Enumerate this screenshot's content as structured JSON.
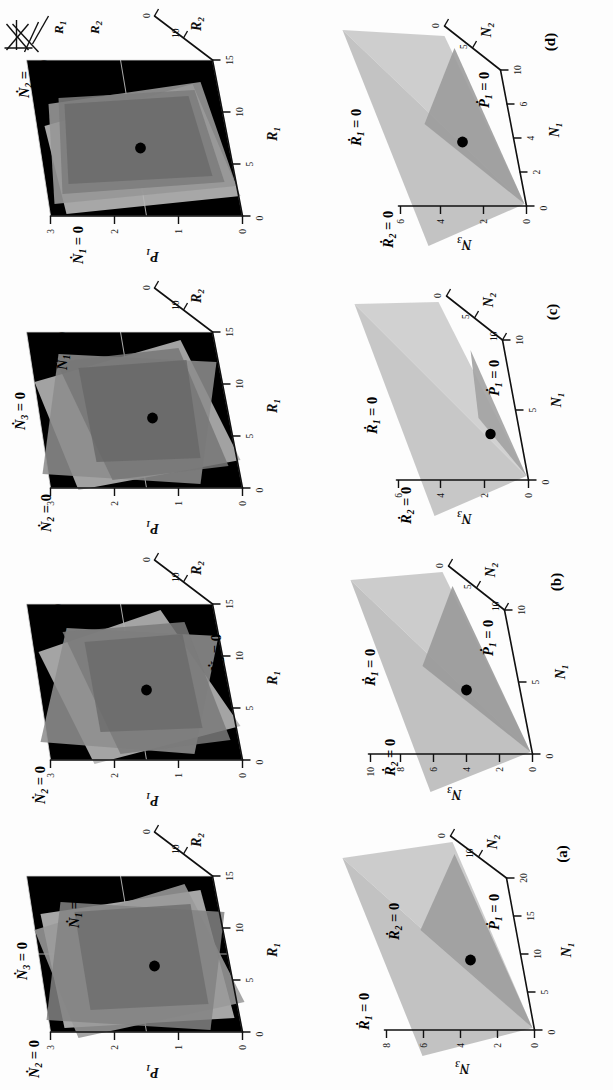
{
  "figure": {
    "orientation": "rotated-90-ccw",
    "panel_count": 4,
    "background": "#fdfdfd"
  },
  "inset": {
    "name": "food-web-diagram",
    "nodes": [
      "R1",
      "R2"
    ],
    "labels": {
      "r1": "R",
      "r1_sub": "1",
      "r2": "R",
      "r2_sub": "2"
    }
  },
  "palette": {
    "surface_light": "#c8c8c8",
    "surface_mid": "#a8a8a8",
    "surface_dark": "#8a8a8a",
    "surface_darker": "#6f6f6f",
    "axis": "#111111",
    "point": "#000000"
  },
  "panels": [
    {
      "id": "a",
      "label": "(a)",
      "top": {
        "name": "p1-r1-r2-nullclines",
        "axes": {
          "z": {
            "symbol": "P",
            "sub": "1",
            "ticks": [
              "0",
              "1",
              "2",
              "3"
            ]
          },
          "x": {
            "symbol": "R",
            "sub": "1",
            "ticks": [
              "0",
              "5",
              "10",
              "15"
            ]
          },
          "y": {
            "symbol": "R",
            "sub": "2",
            "ticks": [
              "10",
              "0"
            ]
          }
        },
        "surface_labels": [
          {
            "sym": "N",
            "sub": "2",
            "text": "= 0"
          },
          {
            "sym": "N",
            "sub": "3",
            "text": "= 0"
          },
          {
            "sym": "N",
            "sub": "1",
            "text": "= 0"
          }
        ],
        "equilibrium_point": true
      },
      "bottom": {
        "name": "n3-n1-n2-nullclines",
        "axes": {
          "z": {
            "symbol": "N",
            "sub": "3",
            "ticks": [
              "0",
              "2",
              "4",
              "6",
              "8"
            ]
          },
          "x": {
            "symbol": "N",
            "sub": "1",
            "ticks": [
              "0",
              "5",
              "10",
              "15",
              "20"
            ]
          },
          "y": {
            "symbol": "N",
            "sub": "2",
            "ticks": [
              "10",
              "0"
            ]
          }
        },
        "surface_labels": [
          {
            "sym": "R",
            "sub": "1",
            "text": "= 0"
          },
          {
            "sym": "R",
            "sub": "2",
            "text": "= 0"
          },
          {
            "sym": "P",
            "sub": "1",
            "text": "= 0"
          }
        ],
        "equilibrium_point": true
      }
    },
    {
      "id": "b",
      "label": "(b)",
      "top": {
        "name": "p1-r1-r2-nullclines",
        "axes": {
          "z": {
            "symbol": "P",
            "sub": "1",
            "ticks": [
              "0",
              "1",
              "2",
              "3"
            ]
          },
          "x": {
            "symbol": "R",
            "sub": "1",
            "ticks": [
              "0",
              "5",
              "10",
              "15"
            ]
          },
          "y": {
            "symbol": "R",
            "sub": "2",
            "ticks": [
              "10",
              "0"
            ]
          }
        },
        "surface_labels": [
          {
            "sym": "N",
            "sub": "2",
            "text": "= 0"
          },
          {
            "sym": "N",
            "sub": "1",
            "text": "= 0"
          },
          {
            "sym": "N",
            "sub": "3",
            "text": "= 0"
          }
        ],
        "equilibrium_point": true
      },
      "bottom": {
        "name": "n3-n1-n2-nullclines",
        "axes": {
          "z": {
            "symbol": "N",
            "sub": "3",
            "ticks": [
              "0",
              "2",
              "4",
              "6",
              "8",
              "10"
            ]
          },
          "x": {
            "symbol": "N",
            "sub": "1",
            "ticks": [
              "0",
              "5",
              "10"
            ]
          },
          "y": {
            "symbol": "N",
            "sub": "2",
            "ticks": [
              "10",
              "5",
              "0"
            ]
          }
        },
        "surface_labels": [
          {
            "sym": "R",
            "sub": "2",
            "text": "= 0"
          },
          {
            "sym": "R",
            "sub": "1",
            "text": "= 0"
          },
          {
            "sym": "P",
            "sub": "1",
            "text": "= 0"
          }
        ],
        "equilibrium_point": true
      }
    },
    {
      "id": "c",
      "label": "(c)",
      "top": {
        "name": "p1-r1-r2-nullclines",
        "axes": {
          "z": {
            "symbol": "P",
            "sub": "1",
            "ticks": [
              "0",
              "1",
              "2",
              "3"
            ]
          },
          "x": {
            "symbol": "R",
            "sub": "1",
            "ticks": [
              "0",
              "5",
              "10",
              "15"
            ]
          },
          "y": {
            "symbol": "R",
            "sub": "2",
            "ticks": [
              "10",
              "0"
            ]
          }
        },
        "surface_labels": [
          {
            "sym": "N",
            "sub": "2",
            "text": "= 0"
          },
          {
            "sym": "N",
            "sub": "3",
            "text": "= 0"
          },
          {
            "sym": "N",
            "sub": "1",
            "text": "= 0"
          }
        ],
        "equilibrium_point": true
      },
      "bottom": {
        "name": "n3-n1-n2-nullclines",
        "axes": {
          "z": {
            "symbol": "N",
            "sub": "3",
            "ticks": [
              "0",
              "2",
              "4",
              "6"
            ]
          },
          "x": {
            "symbol": "N",
            "sub": "1",
            "ticks": [
              "0",
              "5",
              "10"
            ]
          },
          "y": {
            "symbol": "N",
            "sub": "2",
            "ticks": [
              "10",
              "5",
              "0"
            ]
          }
        },
        "surface_labels": [
          {
            "sym": "R",
            "sub": "2",
            "text": "= 0"
          },
          {
            "sym": "R",
            "sub": "1",
            "text": "= 0"
          },
          {
            "sym": "P",
            "sub": "1",
            "text": "= 0"
          }
        ],
        "equilibrium_point": true
      }
    },
    {
      "id": "d",
      "label": "(d)",
      "top": {
        "name": "p1-r1-r2-nullclines",
        "axes": {
          "z": {
            "symbol": "P",
            "sub": "1",
            "ticks": [
              "0",
              "1",
              "2",
              "3"
            ]
          },
          "x": {
            "symbol": "R",
            "sub": "1",
            "ticks": [
              "0",
              "5",
              "10",
              "15"
            ]
          },
          "y": {
            "symbol": "R",
            "sub": "2",
            "ticks": [
              "10",
              "0"
            ]
          }
        },
        "surface_labels": [
          {
            "sym": "N",
            "sub": "1",
            "text": "= 0"
          },
          {
            "sym": "N",
            "sub": "2",
            "text": "="
          },
          {
            "sym": "N",
            "sub": "3",
            "text": "= 0"
          }
        ],
        "equilibrium_point": true
      },
      "bottom": {
        "name": "n3-n1-n2-nullclines",
        "axes": {
          "z": {
            "symbol": "N",
            "sub": "3",
            "ticks": [
              "0",
              "2",
              "4",
              "6"
            ]
          },
          "x": {
            "symbol": "N",
            "sub": "1",
            "ticks": [
              "0",
              "2",
              "4",
              "6",
              "10"
            ]
          },
          "y": {
            "symbol": "N",
            "sub": "2",
            "ticks": [
              "5",
              "0"
            ]
          }
        },
        "surface_labels": [
          {
            "sym": "R",
            "sub": "2",
            "text": "= 0"
          },
          {
            "sym": "R",
            "sub": "1",
            "text": "= 0"
          },
          {
            "sym": "P",
            "sub": "1",
            "text": "= 0"
          }
        ],
        "equilibrium_point": true
      }
    }
  ]
}
